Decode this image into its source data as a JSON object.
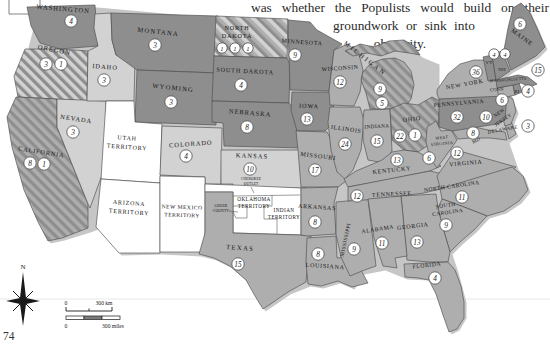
{
  "page": {
    "paragraph_line1": "was whether the Populists would build on their",
    "paragraph_line2": "groundwork or sink into",
    "paragraph_line3": "obscurity.",
    "page_number": "74"
  },
  "compass": {
    "north_label": "N"
  },
  "scale_bar": {
    "km_start": "0",
    "km_end": "300 km",
    "miles_start": "0",
    "miles_end": "300 miles"
  },
  "colors": {
    "republican": "#8e8e8e",
    "democratic": "#aeaeae",
    "populist": "#d2d2d2",
    "territory": "#ffffff",
    "outline": "#4d4d4d",
    "coast_shadow": "#c6c6c6"
  },
  "states": [
    {
      "id": "washington",
      "label": "WASHINGTON",
      "votes": [
        4
      ],
      "fill": "rep"
    },
    {
      "id": "oregon",
      "label": "OREGON",
      "votes": [
        3,
        1
      ],
      "fill": "split_rp"
    },
    {
      "id": "california",
      "label": "CALIFORNIA",
      "votes": [
        8,
        1
      ],
      "fill": "split_dr"
    },
    {
      "id": "nevada",
      "label": "NEVADA",
      "votes": [
        3
      ],
      "fill": "pop"
    },
    {
      "id": "idaho",
      "label": "IDAHO",
      "votes": [
        3
      ],
      "fill": "pop"
    },
    {
      "id": "montana",
      "label": "MONTANA",
      "votes": [
        3
      ],
      "fill": "rep"
    },
    {
      "id": "wyoming",
      "label": "WYOMING",
      "votes": [
        3
      ],
      "fill": "rep"
    },
    {
      "id": "utah",
      "label_lines": [
        "UTAH",
        "TERRITORY"
      ],
      "votes": [],
      "fill": "terr"
    },
    {
      "id": "colorado",
      "label": "COLORADO",
      "votes": [
        4
      ],
      "fill": "pop"
    },
    {
      "id": "arizona",
      "label_lines": [
        "ARIZONA",
        "TERRITORY"
      ],
      "votes": [],
      "fill": "terr"
    },
    {
      "id": "new-mexico",
      "label_lines": [
        "NEW MEXICO",
        "TERRITORY"
      ],
      "votes": [],
      "fill": "terr"
    },
    {
      "id": "north-dakota",
      "label_lines": [
        "NORTH",
        "DAKOTA"
      ],
      "votes": [
        1,
        1,
        1
      ],
      "fill": "split_rdp"
    },
    {
      "id": "south-dakota",
      "label": "SOUTH DAKOTA",
      "votes": [
        4
      ],
      "fill": "rep"
    },
    {
      "id": "nebraska",
      "label": "NEBRASKA",
      "votes": [
        8
      ],
      "fill": "rep"
    },
    {
      "id": "kansas",
      "label": "KANSAS",
      "votes": [
        10
      ],
      "fill": "pop"
    },
    {
      "id": "oklahoma",
      "label_lines": [
        "OKLAHOMA",
        "TERRITORY"
      ],
      "votes": [],
      "fill": "terr"
    },
    {
      "id": "indian-territory",
      "label_lines": [
        "INDIAN",
        "TERRITORY"
      ],
      "votes": [],
      "fill": "none"
    },
    {
      "id": "cherokee-outlet",
      "label_lines": [
        "CHEROKEE",
        "OUTLET"
      ],
      "votes": [],
      "fill": "none"
    },
    {
      "id": "greer-county",
      "label_lines": [
        "GREER",
        "COUNTY"
      ],
      "votes": [],
      "fill": "none"
    },
    {
      "id": "texas",
      "label": "TEXAS",
      "votes": [
        15
      ],
      "fill": "dem"
    },
    {
      "id": "minnesota",
      "label": "MINNESOTA",
      "votes": [
        9
      ],
      "fill": "rep"
    },
    {
      "id": "iowa",
      "label": "IOWA",
      "votes": [
        13
      ],
      "fill": "rep"
    },
    {
      "id": "wisconsin",
      "label": "WISCONSIN",
      "votes": [
        12
      ],
      "fill": "dem"
    },
    {
      "id": "missouri",
      "label": "MISSOURI",
      "votes": [
        17
      ],
      "fill": "dem"
    },
    {
      "id": "arkansas",
      "label": "ARKANSAS",
      "votes": [
        8
      ],
      "fill": "dem"
    },
    {
      "id": "louisiana",
      "label": "LOUISIANA",
      "votes": [
        8
      ],
      "fill": "dem"
    },
    {
      "id": "mississippi",
      "label": "MISSISSIPPI",
      "votes": [
        9
      ],
      "fill": "dem"
    },
    {
      "id": "illinois",
      "label": "ILLINOIS",
      "votes": [
        24
      ],
      "fill": "dem"
    },
    {
      "id": "michigan",
      "label": "MICHIGAN",
      "votes": [
        9,
        5
      ],
      "fill": "split_dr"
    },
    {
      "id": "indiana",
      "label": "INDIANA",
      "votes": [
        15
      ],
      "fill": "dem"
    },
    {
      "id": "ohio",
      "label": "OHIO",
      "votes": [
        22,
        1
      ],
      "fill": "split_dr"
    },
    {
      "id": "kentucky",
      "label": "KENTUCKY",
      "votes": [
        13
      ],
      "fill": "dem"
    },
    {
      "id": "tennessee",
      "label": "TENNESSEE",
      "votes": [
        12
      ],
      "fill": "dem"
    },
    {
      "id": "west-virginia",
      "label_lines": [
        "WEST",
        "VIRGINIA"
      ],
      "votes": [
        6
      ],
      "fill": "dem"
    },
    {
      "id": "virginia",
      "label": "VIRGINIA",
      "votes": [
        12
      ],
      "fill": "dem"
    },
    {
      "id": "north-carolina",
      "label": "NORTH CAROLINA",
      "votes": [
        11
      ],
      "fill": "dem"
    },
    {
      "id": "south-carolina",
      "label_lines": [
        "SOUTH",
        "CAROLINA"
      ],
      "votes": [
        9
      ],
      "fill": "dem"
    },
    {
      "id": "georgia",
      "label": "GEORGIA",
      "votes": [
        13
      ],
      "fill": "dem"
    },
    {
      "id": "alabama",
      "label": "ALABAMA",
      "votes": [
        11
      ],
      "fill": "dem"
    },
    {
      "id": "florida",
      "label": "FLORIDA",
      "votes": [
        4
      ],
      "fill": "dem"
    },
    {
      "id": "maryland",
      "label": "MD",
      "votes": [
        8
      ],
      "fill": "dem"
    },
    {
      "id": "delaware",
      "label": "DELAWARE",
      "votes": [
        3
      ],
      "fill": "dem"
    },
    {
      "id": "new-jersey",
      "label_lines": [
        "NEW",
        "JERSEY"
      ],
      "votes": [
        10
      ],
      "fill": "dem"
    },
    {
      "id": "pennsylvania",
      "label": "PENNSYLVANIA",
      "votes": [
        32
      ],
      "fill": "rep"
    },
    {
      "id": "new-york",
      "label": "NEW YORK",
      "votes": [
        36
      ],
      "fill": "dem"
    },
    {
      "id": "connecticut",
      "label": "CONN",
      "votes": [
        6
      ],
      "fill": "dem"
    },
    {
      "id": "rhode-island",
      "label": "RI",
      "votes": [
        4
      ],
      "fill": "rep"
    },
    {
      "id": "massachusetts",
      "label": "MASSACHUSETTS",
      "votes": [
        15
      ],
      "fill": "rep"
    },
    {
      "id": "vermont",
      "label": "VT",
      "votes": [
        4
      ],
      "fill": "rep"
    },
    {
      "id": "new-hampshire",
      "label": "NH",
      "votes": [
        4
      ],
      "fill": "rep"
    },
    {
      "id": "maine",
      "label": "MAINE",
      "votes": [
        6
      ],
      "fill": "rep"
    }
  ]
}
